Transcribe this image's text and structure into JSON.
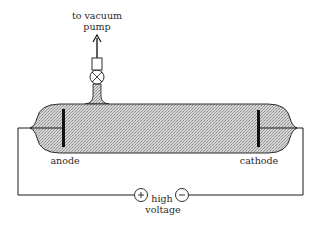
{
  "diagram": {
    "labels": {
      "pump_line1": "to vacuum",
      "pump_line2": "pump",
      "anode": "anode",
      "cathode": "cathode",
      "voltage_line1": "high",
      "voltage_line2": "voltage",
      "plus": "+",
      "minus": "−"
    },
    "colors": {
      "line": "#1a1a1a",
      "gas_fill": "#c9c9c9",
      "background": "#ffffff"
    }
  }
}
